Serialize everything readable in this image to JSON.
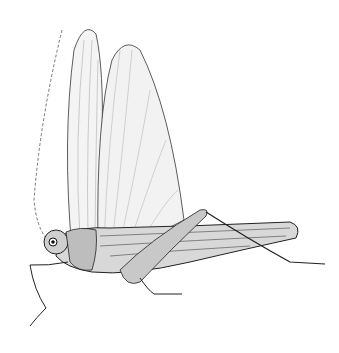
{
  "image": {
    "subject": "grasshopper engraving illustration",
    "background": "#ffffff",
    "ink": "#1a1a1a"
  }
}
